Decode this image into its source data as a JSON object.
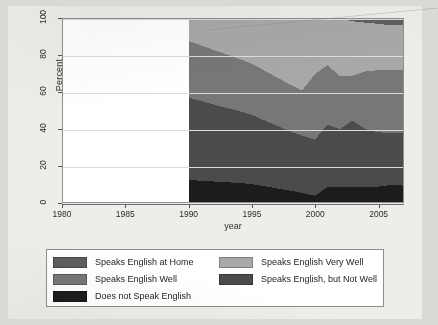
{
  "figure": {
    "background_color": "#ededea",
    "plot_background_color": "#ffffff",
    "frame_color": "#8d8d8d"
  },
  "chart_data": {
    "type": "area",
    "stacked": true,
    "title": "",
    "xlabel": "year",
    "ylabel": "Percent",
    "xlim": [
      1980,
      2007
    ],
    "ylim": [
      0,
      100
    ],
    "grid": true,
    "legend_position": "bottom",
    "xticks": [
      1980,
      1985,
      1990,
      1995,
      2000,
      2005
    ],
    "yticks": [
      0,
      20,
      40,
      60,
      80,
      100
    ],
    "x": [
      1990,
      1991,
      1992,
      1993,
      1994,
      1995,
      1996,
      1997,
      1998,
      1999,
      2000,
      2001,
      2002,
      2003,
      2004,
      2005,
      2006,
      2007
    ],
    "series": [
      {
        "name": "Does not Speak English",
        "color": "#1c1c1c",
        "values": [
          12.0,
          11.6,
          11.2,
          10.8,
          10.4,
          9.8,
          8.6,
          7.4,
          6.2,
          5.0,
          3.4,
          8.2,
          8.3,
          8.2,
          8.2,
          8.4,
          9.2,
          9.0
        ]
      },
      {
        "name": "Speaks English, but Not Well",
        "color": "#4b4b4b",
        "values": [
          45.0,
          43.5,
          42.0,
          40.6,
          39.2,
          37.8,
          36.0,
          34.2,
          32.5,
          31.2,
          30.6,
          34.0,
          31.5,
          36.2,
          31.6,
          29.8,
          28.4,
          29.0
        ]
      },
      {
        "name": "Speaks English Well",
        "color": "#777777",
        "values": [
          31.0,
          30.4,
          29.8,
          29.2,
          28.6,
          28.0,
          27.2,
          26.4,
          25.6,
          24.8,
          35.8,
          32.6,
          29.0,
          24.6,
          31.6,
          33.8,
          34.4,
          34.0
        ]
      },
      {
        "name": "Speaks English Very Well",
        "color": "#a8a8a8",
        "values": [
          12.0,
          14.5,
          17.0,
          19.4,
          21.8,
          24.4,
          28.2,
          32.0,
          35.7,
          39.0,
          30.2,
          25.2,
          31.2,
          29.8,
          26.6,
          25.4,
          24.6,
          25.0
        ]
      },
      {
        "name": "Speaks English at Home",
        "color": "#5e5e5e",
        "values": [
          0.0,
          0.0,
          0.0,
          0.0,
          0.0,
          0.0,
          0.0,
          0.0,
          0.0,
          0.0,
          0.0,
          0.0,
          0.0,
          1.2,
          2.0,
          2.6,
          3.4,
          3.0
        ]
      }
    ]
  },
  "legend": {
    "left_column": [
      {
        "label": "Speaks English at Home",
        "color": "#5e5e5e"
      },
      {
        "label": "Speaks English Well",
        "color": "#777777"
      },
      {
        "label": "Does not Speak English",
        "color": "#1c1c1c"
      }
    ],
    "right_column": [
      {
        "label": "Speaks English Very Well",
        "color": "#a8a8a8"
      },
      {
        "label": "Speaks English, but Not Well",
        "color": "#4b4b4b"
      }
    ]
  }
}
